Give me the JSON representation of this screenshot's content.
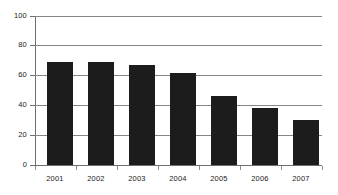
{
  "chart_data": {
    "type": "bar",
    "title": "",
    "subtitle": "",
    "xlabel": "",
    "ylabel": "",
    "categories": [
      "2001",
      "2002",
      "2003",
      "2004",
      "2005",
      "2006",
      "2007"
    ],
    "values": [
      69,
      69,
      67,
      61.5,
      46.5,
      38.5,
      30.5
    ],
    "series": [
      {
        "name": "",
        "values": [
          69,
          69,
          67,
          61.5,
          46.5,
          38.5,
          30.5
        ]
      }
    ],
    "ylim": [
      0,
      100
    ],
    "yticks": [
      0,
      20,
      40,
      60,
      80,
      100
    ],
    "ytick_labels": [
      "0",
      "20",
      "40",
      "60",
      "80",
      "100"
    ],
    "xtick_labels": [
      "2001",
      "2002",
      "2003",
      "2004",
      "2005",
      "2006",
      "2007"
    ],
    "grid": true,
    "grid_axis": "y",
    "legend": false,
    "legend_position": "none",
    "bar_color": "#1c1c1c",
    "grid_color": "#868686",
    "axis_color": "#6e6e6e",
    "background_color": "#ffffff",
    "annotations": []
  }
}
